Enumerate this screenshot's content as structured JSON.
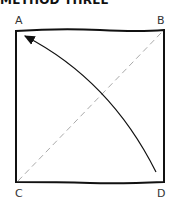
{
  "title": "METHOD THREE",
  "corners": {
    "a": "A",
    "b": "B",
    "c": "C",
    "d": "D"
  },
  "lines": {
    "diagonal": "dashed line from C to B",
    "arrow": "curved arrow from D to A"
  }
}
